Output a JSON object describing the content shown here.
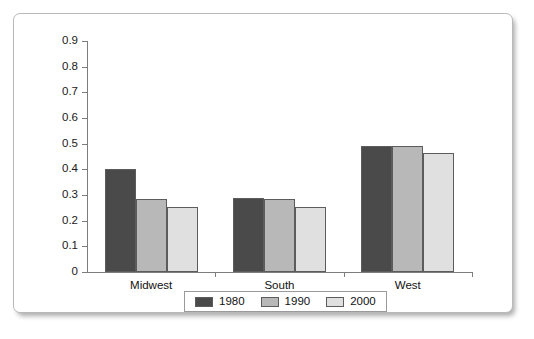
{
  "chart_data": {
    "type": "bar",
    "title": "",
    "subtitle": "",
    "xlabel": "",
    "ylabel": "",
    "categories": [
      "Midwest",
      "South",
      "West"
    ],
    "series": [
      {
        "name": "1980",
        "values": [
          0.4,
          0.29,
          0.49
        ],
        "color": "#4a4a4a"
      },
      {
        "name": "1990",
        "values": [
          0.285,
          0.285,
          0.49
        ],
        "color": "#b8b8b8"
      },
      {
        "name": "2000",
        "values": [
          0.255,
          0.255,
          0.465
        ],
        "color": "#e0e0e0"
      }
    ],
    "ylim": [
      0,
      0.9
    ],
    "ytick_values": [
      0,
      0.1,
      0.2,
      0.3,
      0.4,
      0.5,
      0.6,
      0.7,
      0.8,
      0.9
    ],
    "ytick_labels": [
      "0",
      "0.1",
      "0.2",
      "0.3",
      "0.4",
      "0.5",
      "0.6",
      "0.7",
      "0.8",
      "0.9"
    ],
    "grid": false,
    "legend_position": "bottom",
    "legend_entries": [
      "1980",
      "1990",
      "2000"
    ]
  },
  "colors": {
    "series_1980": "#4a4a4a",
    "series_1990": "#b8b8b8",
    "series_2000": "#e0e0e0",
    "axis": "#7d7d7d",
    "bar_border": "#5c5c5c",
    "frame_border": "#b9b9b9",
    "text": "#111111",
    "background": "#ffffff"
  }
}
